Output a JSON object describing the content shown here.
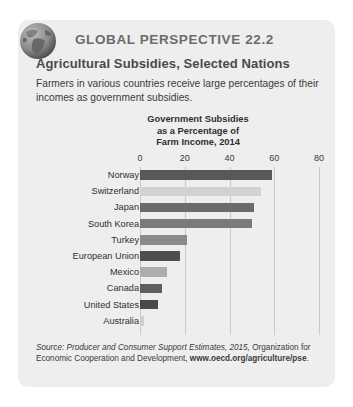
{
  "card": {
    "header": "GLOBAL PERSPECTIVE 22.2",
    "subheader": "Agricultural Subsidies, Selected Nations",
    "intro": "Farmers in various countries receive large percentages of their incomes as government subsidies.",
    "globe_icon": "globe-icon"
  },
  "source": {
    "prefix": "Source:",
    "italic_title": "Producer and Consumer Support Estimates, 2015,",
    "middle": " Organization for Economic Cooperation and Development, ",
    "url": "www.oecd.org/agriculture/pse",
    "period": "."
  },
  "chart_data": {
    "type": "bar",
    "orientation": "horizontal",
    "title_lines": [
      "Government Subsidies",
      "as a Percentage of",
      "Farm Income, 2014"
    ],
    "xlabel": "",
    "ylabel": "",
    "xlim": [
      0,
      80
    ],
    "ticks": [
      0,
      20,
      40,
      60,
      80
    ],
    "tick_labels": [
      "0",
      "20",
      "40",
      "60",
      "80"
    ],
    "grid": true,
    "legend": "none",
    "categories": [
      "Norway",
      "Switzerland",
      "Japan",
      "South Korea",
      "Turkey",
      "European Union",
      "Mexico",
      "Canada",
      "United States",
      "Australia"
    ],
    "values": [
      59,
      54,
      51,
      50,
      21,
      18,
      12,
      10,
      8,
      2
    ],
    "colors": [
      "#585858",
      "#d2d2d2",
      "#6b6b6b",
      "#7a7a7a",
      "#8a8a8a",
      "#4e4e4e",
      "#adadad",
      "#5e5e5e",
      "#4a4a4a",
      "#cfcfcf"
    ],
    "accent_dark": "#585858",
    "accent_light": "#d2d2d2",
    "grid_color": "#c9c9c9",
    "background": "#eeeeee"
  }
}
